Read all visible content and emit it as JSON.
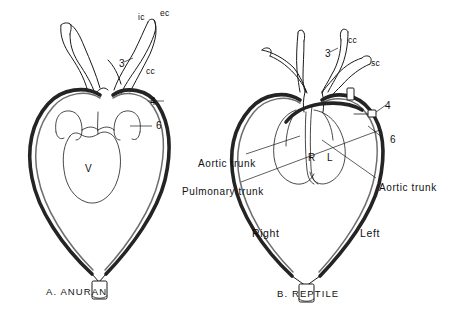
{
  "figure": {
    "background_color": "#ffffff",
    "ink_color": "#1a1a1a",
    "vessel_shade_color": "#4a4a4a",
    "panels": [
      {
        "id": "anuran",
        "caption": "A.  ANURAN",
        "labels": [
          {
            "name": "internal-carotid",
            "text": "ic",
            "x": 138,
            "y": 12,
            "kind": "small"
          },
          {
            "name": "external-carotid",
            "text": "ec",
            "x": 160,
            "y": 8,
            "kind": "small"
          },
          {
            "name": "arch-three",
            "text": "3",
            "x": 119,
            "y": 58,
            "kind": "num"
          },
          {
            "name": "common-carotid",
            "text": "cc",
            "x": 146,
            "y": 66,
            "kind": "small"
          },
          {
            "name": "arch-four",
            "text": "4",
            "x": 150,
            "y": 96,
            "kind": "num"
          },
          {
            "name": "arch-six",
            "text": "6",
            "x": 156,
            "y": 120,
            "kind": "num"
          },
          {
            "name": "ventricle",
            "text": "V",
            "x": 85,
            "y": 163,
            "kind": "chamber"
          }
        ]
      },
      {
        "id": "reptile",
        "caption": "B.  REPTILE",
        "labels": [
          {
            "name": "common-carotid",
            "text": "cc",
            "x": 348,
            "y": 35,
            "kind": "small"
          },
          {
            "name": "arch-three",
            "text": "3",
            "x": 325,
            "y": 48,
            "kind": "num"
          },
          {
            "name": "subclavian",
            "text": "sc",
            "x": 371,
            "y": 58,
            "kind": "small"
          },
          {
            "name": "arch-four",
            "text": "4",
            "x": 385,
            "y": 100,
            "kind": "num"
          },
          {
            "name": "arch-six",
            "text": "6",
            "x": 390,
            "y": 134,
            "kind": "num"
          },
          {
            "name": "right-chamber",
            "text": "R",
            "x": 308,
            "y": 152,
            "kind": "chamber"
          },
          {
            "name": "left-chamber",
            "text": "L",
            "x": 327,
            "y": 152,
            "kind": "chamber"
          },
          {
            "name": "aortic-trunk-left-side",
            "text": "Aortic trunk",
            "x": 198,
            "y": 158,
            "kind": "trunk"
          },
          {
            "name": "pulmonary-trunk",
            "text": "Pulmonary trunk",
            "x": 182,
            "y": 186,
            "kind": "trunk"
          },
          {
            "name": "aortic-trunk-right-side",
            "text": "Aortic trunk",
            "x": 379,
            "y": 182,
            "kind": "trunk"
          },
          {
            "name": "right-side",
            "text": "Right",
            "x": 252,
            "y": 227,
            "kind": "side"
          },
          {
            "name": "left-side",
            "text": "Left",
            "x": 360,
            "y": 227,
            "kind": "side"
          }
        ]
      }
    ]
  }
}
